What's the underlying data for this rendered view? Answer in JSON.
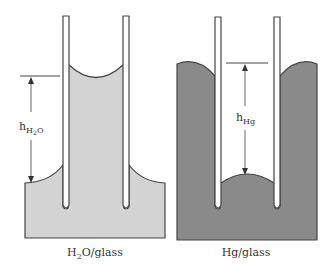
{
  "diagrams": [
    {
      "id": "water",
      "caption": "H₂O/glass",
      "caption_main": "H",
      "caption_sub": "2",
      "caption_rest": "O/glass",
      "height_label_main": "h",
      "height_label_sub": "H₂O",
      "height_label_sub_a": "H",
      "height_label_sub_b": "2",
      "height_label_sub_c": "O",
      "meniscus": "concave",
      "fill_color": "#d3d3d3"
    },
    {
      "id": "mercury",
      "caption": "Hg/glass",
      "height_label_main": "h",
      "height_label_sub": "Hg",
      "meniscus": "convex",
      "fill_color": "#8a8a8a"
    }
  ],
  "colors": {
    "outline": "#444444",
    "water": "#d3d3d3",
    "mercury": "#8a8a8a",
    "glass": "#ffffff"
  }
}
